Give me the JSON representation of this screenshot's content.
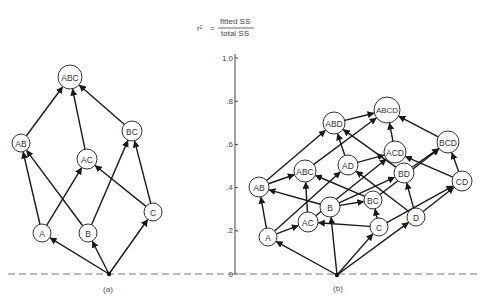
{
  "formula": {
    "lhs": "r²",
    "equals": "=",
    "numerator": "fitted SS",
    "denominator": "total SS"
  },
  "axis": {
    "ticks": [
      {
        "label": "1.0",
        "value": 1.0
      },
      {
        "label": ".8",
        "value": 0.8
      },
      {
        "label": ".6",
        "value": 0.6
      },
      {
        "label": ".4",
        "value": 0.4
      },
      {
        "label": ".2",
        "value": 0.2
      },
      {
        "label": "0",
        "value": 0.0
      }
    ]
  },
  "panels": [
    {
      "id": "a",
      "caption": "(a)",
      "origin": {
        "x": 109,
        "y": 274
      },
      "nodes": [
        {
          "id": "A",
          "label": "A",
          "x": 42,
          "y": 233,
          "r": 9
        },
        {
          "id": "B",
          "label": "B",
          "x": 88,
          "y": 233,
          "r": 9
        },
        {
          "id": "C",
          "label": "C",
          "x": 153,
          "y": 212,
          "r": 9
        },
        {
          "id": "AB",
          "label": "AB",
          "x": 21,
          "y": 143,
          "r": 9
        },
        {
          "id": "AC",
          "label": "AC",
          "x": 87,
          "y": 159,
          "r": 10
        },
        {
          "id": "BC",
          "label": "BC",
          "x": 132,
          "y": 131,
          "r": 10
        },
        {
          "id": "ABC",
          "label": "ABC",
          "x": 70,
          "y": 77,
          "r": 12
        }
      ],
      "edges": [
        [
          "origin",
          "A"
        ],
        [
          "origin",
          "B"
        ],
        [
          "origin",
          "C"
        ],
        [
          "A",
          "AB"
        ],
        [
          "A",
          "AC"
        ],
        [
          "B",
          "AB"
        ],
        [
          "B",
          "BC"
        ],
        [
          "C",
          "AC"
        ],
        [
          "C",
          "BC"
        ],
        [
          "AB",
          "ABC"
        ],
        [
          "AC",
          "ABC"
        ],
        [
          "BC",
          "ABC"
        ]
      ]
    },
    {
      "id": "b",
      "caption": "(b)",
      "origin": {
        "x": 337,
        "y": 275
      },
      "nodes": [
        {
          "id": "A",
          "label": "A",
          "x": 268,
          "y": 237,
          "r": 9
        },
        {
          "id": "B",
          "label": "B",
          "x": 330,
          "y": 207,
          "r": 10
        },
        {
          "id": "C",
          "label": "C",
          "x": 379,
          "y": 227,
          "r": 9
        },
        {
          "id": "D",
          "label": "D",
          "x": 416,
          "y": 217,
          "r": 9
        },
        {
          "id": "AB",
          "label": "AB",
          "x": 259,
          "y": 187,
          "r": 10
        },
        {
          "id": "AC",
          "label": "AC",
          "x": 308,
          "y": 222,
          "r": 10
        },
        {
          "id": "AD",
          "label": "AD",
          "x": 348,
          "y": 165,
          "r": 10
        },
        {
          "id": "BC",
          "label": "BC",
          "x": 373,
          "y": 200,
          "r": 9
        },
        {
          "id": "BD",
          "label": "BD",
          "x": 404,
          "y": 173,
          "r": 10
        },
        {
          "id": "CD",
          "label": "CD",
          "x": 462,
          "y": 181,
          "r": 10
        },
        {
          "id": "ABC",
          "label": "ABC",
          "x": 305,
          "y": 171,
          "r": 11
        },
        {
          "id": "ABD",
          "label": "ABD",
          "x": 334,
          "y": 123,
          "r": 11
        },
        {
          "id": "ACD",
          "label": "ACD",
          "x": 395,
          "y": 152,
          "r": 11
        },
        {
          "id": "BCD",
          "label": "BCD",
          "x": 448,
          "y": 142,
          "r": 11
        },
        {
          "id": "ABCD",
          "label": "ABCD",
          "x": 387,
          "y": 110,
          "r": 13
        }
      ],
      "edges": [
        [
          "origin",
          "A"
        ],
        [
          "origin",
          "B"
        ],
        [
          "origin",
          "C"
        ],
        [
          "origin",
          "D"
        ],
        [
          "A",
          "AB"
        ],
        [
          "A",
          "AC"
        ],
        [
          "A",
          "AD"
        ],
        [
          "B",
          "AB"
        ],
        [
          "B",
          "BC"
        ],
        [
          "B",
          "BD"
        ],
        [
          "C",
          "AC"
        ],
        [
          "C",
          "BC"
        ],
        [
          "C",
          "CD"
        ],
        [
          "D",
          "AD"
        ],
        [
          "D",
          "BD"
        ],
        [
          "D",
          "CD"
        ],
        [
          "AB",
          "ABC"
        ],
        [
          "AB",
          "ABD"
        ],
        [
          "AC",
          "ABC"
        ],
        [
          "AC",
          "ACD"
        ],
        [
          "AD",
          "ABD"
        ],
        [
          "AD",
          "ACD"
        ],
        [
          "BC",
          "ABC"
        ],
        [
          "BC",
          "BCD"
        ],
        [
          "BD",
          "ABD"
        ],
        [
          "BD",
          "BCD"
        ],
        [
          "CD",
          "ACD"
        ],
        [
          "CD",
          "BCD"
        ],
        [
          "ABC",
          "ABCD"
        ],
        [
          "ABD",
          "ABCD"
        ],
        [
          "ACD",
          "ABCD"
        ],
        [
          "BCD",
          "ABCD"
        ]
      ]
    }
  ],
  "colors": {
    "line": "#1a1a1a",
    "node_stroke": "#333333",
    "dashed_baseline": "#777777"
  }
}
